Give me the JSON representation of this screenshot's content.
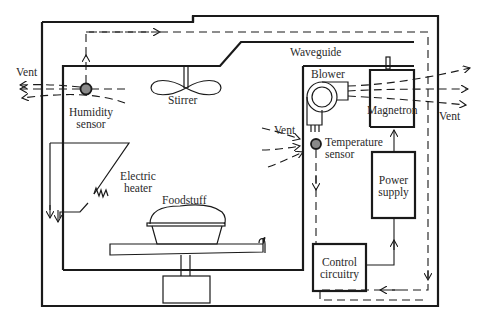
{
  "diagram": {
    "labels": {
      "vent_left": "Vent",
      "humidity_sensor_line1": "Humidity",
      "humidity_sensor_line2": "sensor",
      "stirrer": "Stirrer",
      "waveguide": "Waveguide",
      "blower": "Blower",
      "magnetron": "Magnetron",
      "vent_right": "Vent",
      "vent_middle": "Vent",
      "temperature_sensor_line1": "Temperature",
      "temperature_sensor_line2": "sensor",
      "electric_heater_line1": "Electric",
      "electric_heater_line2": "heater",
      "foodstuff": "Foodstuff",
      "power_supply_line1": "Power",
      "power_supply_line2": "supply",
      "control_circuitry_line1": "Control",
      "control_circuitry_line2": "circuitry"
    },
    "colors": {
      "line": "#1a1a1a",
      "sensor_fill": "#8a8a8a",
      "background": "#ffffff"
    }
  }
}
